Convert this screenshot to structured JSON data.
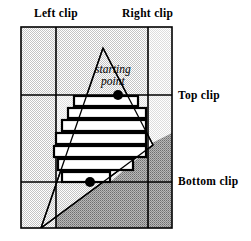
{
  "figure": {
    "labels": {
      "left_clip": "Left clip",
      "right_clip": "Right clip",
      "top_clip": "Top clip",
      "bottom_clip": "Bottom clip",
      "starting_point_line1": "starting",
      "starting_point_line2": "point"
    },
    "colors": {
      "outline": "#000000",
      "light_shade": "#d9d9d9",
      "mid_shade": "#c9c9c9",
      "dark_shade": "#8f8f8f",
      "interior": "#ffffff",
      "background": "#ffffff"
    },
    "geometry": {
      "box": {
        "x": 21,
        "y": 27,
        "width": 151,
        "height": 201
      },
      "clip_lines": {
        "left_clip_x": 56,
        "right_clip_x": 148,
        "top_clip_y": 95,
        "bottom_clip_y": 182
      },
      "triangle": [
        {
          "x": 103,
          "y": 48
        },
        {
          "x": 41,
          "y": 228
        },
        {
          "x": 153,
          "y": 145
        }
      ],
      "points": [
        {
          "name": "starting-point",
          "x": 118,
          "y": 95,
          "r": 5
        },
        {
          "name": "lower-point",
          "x": 90,
          "y": 182,
          "r": 5
        }
      ],
      "spans": [
        {
          "x": 74,
          "y": 96,
          "width": 64,
          "height": 10
        },
        {
          "x": 68,
          "y": 108,
          "width": 78,
          "height": 10
        },
        {
          "x": 62,
          "y": 120,
          "width": 84,
          "height": 11
        },
        {
          "x": 56,
          "y": 133,
          "width": 90,
          "height": 11
        },
        {
          "x": 54,
          "y": 146,
          "width": 92,
          "height": 11
        },
        {
          "x": 58,
          "y": 159,
          "width": 75,
          "height": 11
        },
        {
          "x": 62,
          "y": 172,
          "width": 48,
          "height": 10
        }
      ]
    }
  }
}
